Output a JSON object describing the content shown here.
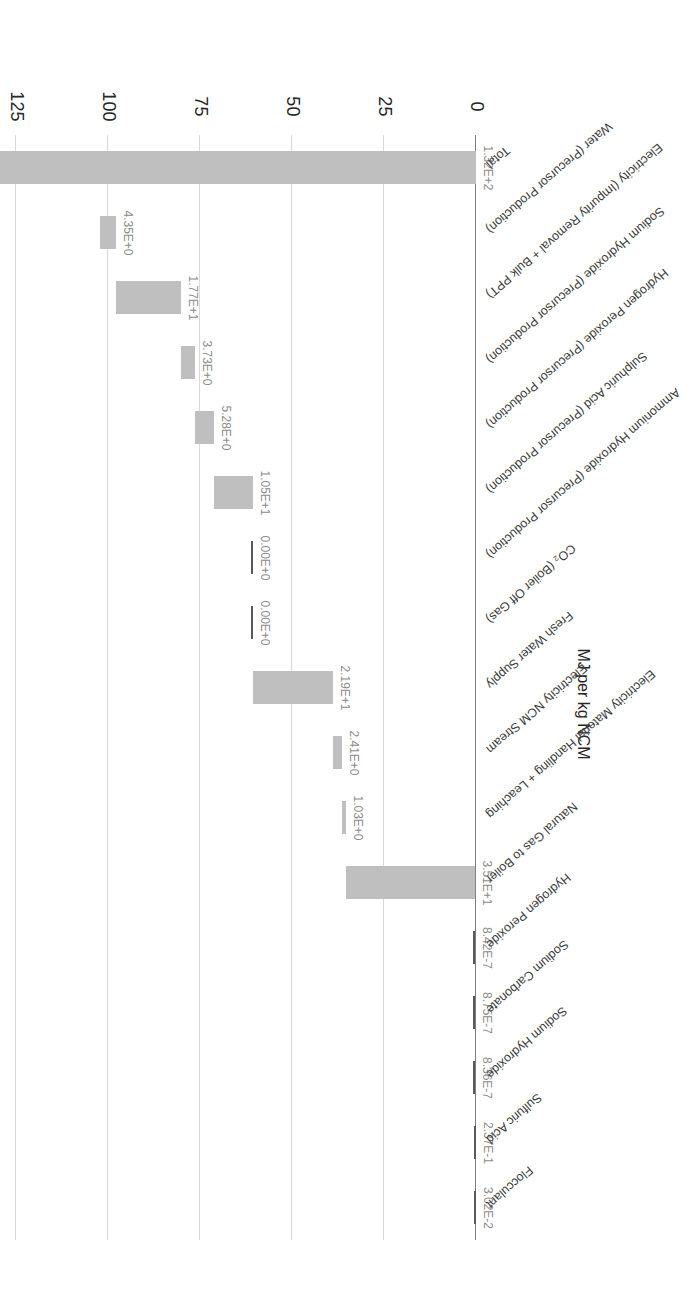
{
  "chart_data": {
    "type": "bar",
    "chart_subtype": "waterfall",
    "title": "",
    "xlabel": "",
    "ylabel": "MJ per kg NCM",
    "ylim": [
      0,
      125
    ],
    "yticks": [
      0,
      25,
      50,
      75,
      100,
      125
    ],
    "ytick_labels": [
      "0",
      "25",
      "50",
      "75",
      "100",
      "125"
    ],
    "grid": true,
    "legend": false,
    "orientation": "rotated-180",
    "bar_color": "#bfbfbf",
    "zero_bar_color": "#595959",
    "categories": [
      "Flocculant",
      "Sulfuric Acid",
      "Sodium Hydroxide",
      "Sodium Carbonate",
      "Hydrogen Peroxide",
      "Natural Gas to Boiler",
      "Electricity Material Handling + Leaching",
      "Electricity NCM Stream",
      "Fresh Water Supply",
      "CO₂ (Boiler Off Gas)",
      "Ammonium Hydroxide (Precursor Production)",
      "Sulphuric Acid (Precursor Production)",
      "Hydrogen Peroxide (Precursor Production)",
      "Sodium Hydroxide (Precursor Production)",
      "Electricity (Impurity Removal + Bulk PPT)",
      "Water (Precursor Production)",
      "Total"
    ],
    "values": [
      0.0302,
      0.237,
      8.36e-07,
      8.75e-07,
      8.42e-07,
      35.1,
      1.03,
      2.41,
      21.9,
      0.0,
      0.0,
      10.5,
      5.28,
      3.73,
      17.7,
      4.35,
      132.0
    ],
    "value_labels": [
      "3.02E-2",
      "2.37E-1",
      "8.36E-7",
      "8.75E-7",
      "8.42E-7",
      "3.51E+1",
      "1.03E+0",
      "2.41E+0",
      "2.19E+1",
      "0.00E+0",
      "0.00E+0",
      "1.05E+1",
      "5.28E+0",
      "3.73E+0",
      "1.77E+1",
      "4.35E+0",
      "1.32E+2"
    ],
    "cumulative_start": [
      0.0,
      0.0302,
      0.2672,
      0.2672,
      0.2672,
      0.2672,
      35.37,
      36.4,
      38.81,
      60.71,
      60.71,
      60.71,
      71.21,
      76.49,
      80.22,
      97.92,
      0.0
    ],
    "cumulative_end": [
      0.0302,
      0.2672,
      0.2672,
      0.2672,
      0.2672,
      35.37,
      36.4,
      38.81,
      60.71,
      60.71,
      60.71,
      71.21,
      76.49,
      80.22,
      97.92,
      102.27,
      132.0
    ],
    "is_total": [
      false,
      false,
      false,
      false,
      false,
      false,
      false,
      false,
      false,
      false,
      false,
      false,
      false,
      false,
      false,
      false,
      true
    ]
  }
}
